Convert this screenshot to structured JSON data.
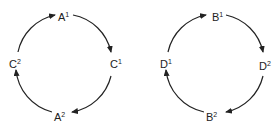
{
  "diagram": {
    "stroke_color": "#222222",
    "cycles": [
      {
        "name": "cycle-left",
        "direction": "clockwise",
        "nodes": [
          {
            "id": "A1",
            "base": "A",
            "sup": "1",
            "position": "top"
          },
          {
            "id": "C1",
            "base": "C",
            "sup": "1",
            "position": "right"
          },
          {
            "id": "A2",
            "base": "A",
            "sup": "2",
            "position": "bottom"
          },
          {
            "id": "C2",
            "base": "C",
            "sup": "2",
            "position": "left"
          }
        ]
      },
      {
        "name": "cycle-right",
        "direction": "clockwise",
        "nodes": [
          {
            "id": "B1",
            "base": "B",
            "sup": "1",
            "position": "top"
          },
          {
            "id": "D2",
            "base": "D",
            "sup": "2",
            "position": "right"
          },
          {
            "id": "B2",
            "base": "B",
            "sup": "2",
            "position": "bottom"
          },
          {
            "id": "D1",
            "base": "D",
            "sup": "1",
            "position": "left"
          }
        ]
      }
    ]
  }
}
